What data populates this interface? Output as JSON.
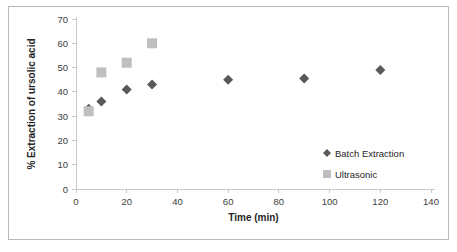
{
  "chart_data": {
    "type": "scatter",
    "title": "",
    "xlabel": "Time (min)",
    "ylabel": "% Extraction of ursolic acid",
    "xlim": [
      0,
      140
    ],
    "ylim": [
      0,
      70
    ],
    "xticks": [
      0,
      20,
      40,
      60,
      80,
      100,
      120,
      140
    ],
    "yticks": [
      0,
      10,
      20,
      30,
      40,
      50,
      60,
      70
    ],
    "grid": false,
    "legend_position": "inside-right",
    "series": [
      {
        "name": "Batch Extraction",
        "marker": "diamond",
        "color": "#595959",
        "x": [
          5,
          10,
          20,
          30,
          60,
          90,
          120
        ],
        "y": [
          33,
          36,
          41,
          43,
          45,
          45.5,
          49
        ]
      },
      {
        "name": "Ultrasonic",
        "marker": "square",
        "color": "#bfbfbf",
        "x": [
          5,
          10,
          20,
          30
        ],
        "y": [
          32,
          48,
          52,
          60
        ]
      }
    ]
  },
  "legend": {
    "entries": [
      {
        "label": "Batch Extraction",
        "marker": "diamond",
        "color": "#595959"
      },
      {
        "label": "Ultrasonic",
        "marker": "square",
        "color": "#bfbfbf"
      }
    ]
  },
  "axes": {
    "x_title": "Time (min)",
    "y_title": "% Extraction of ursolic acid",
    "x_tick_labels": [
      "0",
      "20",
      "40",
      "60",
      "80",
      "100",
      "120",
      "140"
    ],
    "y_tick_labels": [
      "0",
      "10",
      "20",
      "30",
      "40",
      "50",
      "60",
      "70"
    ]
  },
  "colors": {
    "batch_marker": "#595959",
    "ultrasonic_marker": "#bfbfbf",
    "axis": "#c8c8c8",
    "frame": "#b9b9b9",
    "text": "#262626"
  }
}
